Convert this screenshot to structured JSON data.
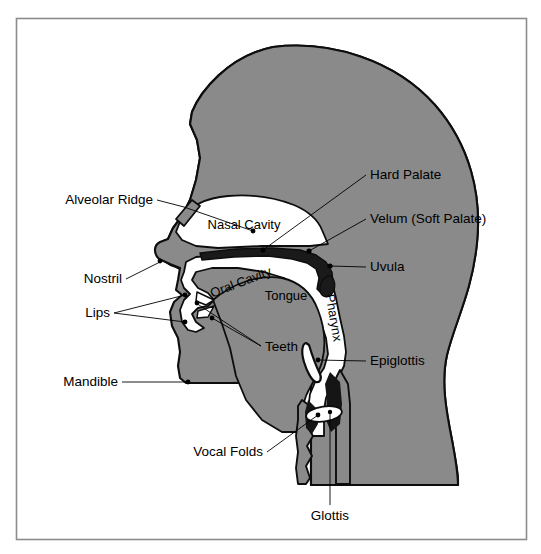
{
  "figure": {
    "frame": {
      "x": 16,
      "y": 18,
      "width": 511,
      "height": 522,
      "stroke": "#8c8c8c"
    },
    "colors": {
      "background": "#ffffff",
      "tissue_fill": "#8a8a8a",
      "outline": "#0d0d0d",
      "cavity_fill": "#ffffff",
      "palate_band": "#1a1a1a",
      "label_text": "#000000",
      "leader_line": "#000000",
      "frame_border": "#8c8c8c"
    }
  },
  "labels": {
    "external": [
      {
        "id": "alveolar-ridge",
        "text": "Alveolar Ridge",
        "anchor": "end",
        "tx": 153,
        "ty": 200,
        "points": [
          [
            157,
            200
          ],
          [
            184,
            207
          ],
          [
            253,
            231
          ]
        ],
        "dot": [
          160,
          261
        ]
      },
      {
        "id": "nostril",
        "text": "Nostril",
        "anchor": "end",
        "tx": 122,
        "ty": 279,
        "points": [
          [
            126,
            279
          ],
          [
            160,
            262
          ]
        ],
        "dot": [
          160,
          261
        ]
      },
      {
        "id": "lips",
        "text": "Lips",
        "anchor": "end",
        "tx": 110,
        "ty": 313,
        "points": [
          [
            114,
            313
          ],
          [
            185,
            295
          ]
        ],
        "points2": [
          [
            114,
            313
          ],
          [
            185,
            322
          ]
        ],
        "dot": [
          185,
          295
        ]
      },
      {
        "id": "teeth",
        "text": "Teeth",
        "anchor": "start",
        "tx": 265,
        "ty": 347,
        "points": [
          [
            261,
            346
          ],
          [
            196,
            303
          ]
        ],
        "points2": [
          [
            261,
            346
          ],
          [
            212,
            318
          ]
        ],
        "dot": [
          196,
          303
        ]
      },
      {
        "id": "mandible",
        "text": "Mandible",
        "anchor": "end",
        "tx": 118,
        "ty": 382,
        "points": [
          [
            122,
            382
          ],
          [
            188,
            382
          ]
        ],
        "dot": [
          188,
          382
        ]
      },
      {
        "id": "vocal-folds",
        "text": "Vocal Folds",
        "anchor": "end",
        "tx": 263,
        "ty": 452,
        "points": [
          [
            267,
            452
          ],
          [
            318,
            415
          ]
        ],
        "dot": [
          318,
          415
        ]
      },
      {
        "id": "glottis",
        "text": "Glottis",
        "anchor": "middle",
        "tx": 330,
        "ty": 516,
        "points": [
          [
            330,
            505
          ],
          [
            330,
            412
          ]
        ],
        "dot": [
          330,
          412
        ]
      },
      {
        "id": "hard-palate",
        "text": "Hard Palate",
        "anchor": "start",
        "tx": 370,
        "ty": 175,
        "points": [
          [
            366,
            175
          ],
          [
            263,
            250
          ]
        ],
        "dot": [
          263,
          250
        ]
      },
      {
        "id": "velum",
        "text": "Velum (Soft Palate)",
        "anchor": "start",
        "tx": 370,
        "ty": 219,
        "points": [
          [
            366,
            219
          ],
          [
            309,
            251
          ]
        ],
        "dot": [
          309,
          251
        ]
      },
      {
        "id": "uvula",
        "text": "Uvula",
        "anchor": "start",
        "tx": 370,
        "ty": 267,
        "points": [
          [
            366,
            267
          ],
          [
            330,
            266
          ]
        ],
        "dot": [
          330,
          266
        ]
      },
      {
        "id": "epiglottis",
        "text": "Epiglottis",
        "anchor": "start",
        "tx": 370,
        "ty": 361,
        "points": [
          [
            366,
            361
          ],
          [
            318,
            360
          ]
        ],
        "dot": [
          318,
          360
        ]
      }
    ],
    "internal": [
      {
        "id": "nasal-cavity",
        "text": "Nasal Cavity",
        "x": 244,
        "y": 226,
        "rotate": 0
      },
      {
        "id": "oral-cavity",
        "text": "Oral Cavity",
        "x": 241,
        "y": 283,
        "rotate": -21
      },
      {
        "id": "tongue",
        "text": "Tongue",
        "x": 286,
        "y": 297,
        "rotate": 0
      },
      {
        "id": "pharynx",
        "text": "Pharynx",
        "x": 333,
        "y": 318,
        "rotate": 80
      }
    ]
  },
  "anatomy": {
    "parts": [
      "head-and-neck-silhouette",
      "nasal-cavity",
      "oral-cavity",
      "pharyngeal-cavity",
      "tongue",
      "hard-palate",
      "velum",
      "uvula",
      "epiglottis",
      "vocal-folds",
      "glottis",
      "larynx",
      "mandible",
      "lips",
      "teeth",
      "alveolar-ridge",
      "nostril"
    ]
  }
}
